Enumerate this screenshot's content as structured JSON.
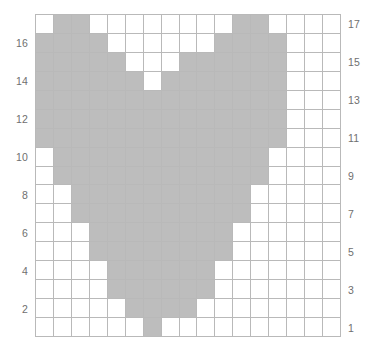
{
  "chart_data": {
    "type": "heatmap",
    "title": "",
    "subtitle": "",
    "xlabel": "",
    "ylabel": "",
    "grid": true,
    "legend": "none",
    "columns": 17,
    "rows": 17,
    "colors": {
      "filled": "#bdbdbd",
      "empty": "#ffffff",
      "gridline": "#b9b9b9",
      "label": "#6f6f6f"
    },
    "left_axis_ticks": [
      "16",
      "14",
      "12",
      "10",
      "8",
      "6",
      "4",
      "2"
    ],
    "right_axis_ticks": [
      "17",
      "15",
      "13",
      "11",
      "9",
      "7",
      "5",
      "3",
      "1"
    ],
    "left_axis_rows": [
      16,
      14,
      12,
      10,
      8,
      6,
      4,
      2
    ],
    "right_axis_rows": [
      17,
      15,
      13,
      11,
      9,
      7,
      5,
      3,
      1
    ],
    "row_numbers_top_to_bottom": [
      17,
      16,
      15,
      14,
      13,
      12,
      11,
      10,
      9,
      8,
      7,
      6,
      5,
      4,
      3,
      2,
      1
    ],
    "cells": [
      [
        0,
        1,
        1,
        0,
        0,
        0,
        0,
        0,
        0,
        0,
        0,
        1,
        1,
        0,
        0,
        0,
        0
      ],
      [
        1,
        1,
        1,
        1,
        0,
        0,
        0,
        0,
        0,
        0,
        1,
        1,
        1,
        1,
        0,
        0,
        0
      ],
      [
        1,
        1,
        1,
        1,
        1,
        0,
        0,
        0,
        1,
        1,
        1,
        1,
        1,
        1,
        0,
        0,
        0
      ],
      [
        1,
        1,
        1,
        1,
        1,
        1,
        0,
        1,
        1,
        1,
        1,
        1,
        1,
        1,
        0,
        0,
        0
      ],
      [
        1,
        1,
        1,
        1,
        1,
        1,
        1,
        1,
        1,
        1,
        1,
        1,
        1,
        1,
        0,
        0,
        0
      ],
      [
        1,
        1,
        1,
        1,
        1,
        1,
        1,
        1,
        1,
        1,
        1,
        1,
        1,
        1,
        0,
        0,
        0
      ],
      [
        1,
        1,
        1,
        1,
        1,
        1,
        1,
        1,
        1,
        1,
        1,
        1,
        1,
        1,
        0,
        0,
        0
      ],
      [
        0,
        1,
        1,
        1,
        1,
        1,
        1,
        1,
        1,
        1,
        1,
        1,
        1,
        0,
        0,
        0,
        0
      ],
      [
        0,
        1,
        1,
        1,
        1,
        1,
        1,
        1,
        1,
        1,
        1,
        1,
        1,
        0,
        0,
        0,
        0
      ],
      [
        0,
        0,
        1,
        1,
        1,
        1,
        1,
        1,
        1,
        1,
        1,
        1,
        0,
        0,
        0,
        0,
        0
      ],
      [
        0,
        0,
        1,
        1,
        1,
        1,
        1,
        1,
        1,
        1,
        1,
        1,
        0,
        0,
        0,
        0,
        0
      ],
      [
        0,
        0,
        0,
        1,
        1,
        1,
        1,
        1,
        1,
        1,
        1,
        0,
        0,
        0,
        0,
        0,
        0
      ],
      [
        0,
        0,
        0,
        1,
        1,
        1,
        1,
        1,
        1,
        1,
        1,
        0,
        0,
        0,
        0,
        0,
        0
      ],
      [
        0,
        0,
        0,
        0,
        1,
        1,
        1,
        1,
        1,
        1,
        0,
        0,
        0,
        0,
        0,
        0,
        0
      ],
      [
        0,
        0,
        0,
        0,
        1,
        1,
        1,
        1,
        1,
        1,
        0,
        0,
        0,
        0,
        0,
        0,
        0
      ],
      [
        0,
        0,
        0,
        0,
        0,
        1,
        1,
        1,
        1,
        0,
        0,
        0,
        0,
        0,
        0,
        0,
        0
      ],
      [
        0,
        0,
        0,
        0,
        0,
        0,
        1,
        0,
        0,
        0,
        0,
        0,
        0,
        0,
        0,
        0,
        0
      ]
    ]
  }
}
